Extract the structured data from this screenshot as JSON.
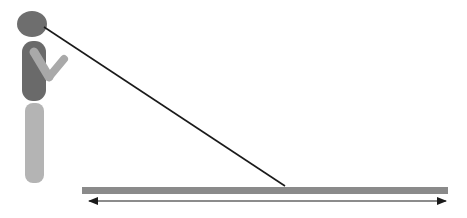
{
  "diagram": {
    "colors": {
      "background": "#ffffff",
      "head": "#6e6e6e",
      "torso": "#6a6a6a",
      "arm": "#a9a9a9",
      "legs": "#b4b4b4",
      "sight_line": "#1a1a1a",
      "ground_bar": "#8a8a8a",
      "arrow": "#1a1a1a"
    },
    "sight_line": {
      "x1": 44,
      "y1": 27,
      "x2": 285,
      "y2": 186
    },
    "ground_bar": {
      "x": 82,
      "y": 187,
      "width": 366,
      "height": 7
    },
    "distance_arrow": {
      "x1": 88,
      "x2": 447,
      "y": 201,
      "heads": "both"
    }
  }
}
